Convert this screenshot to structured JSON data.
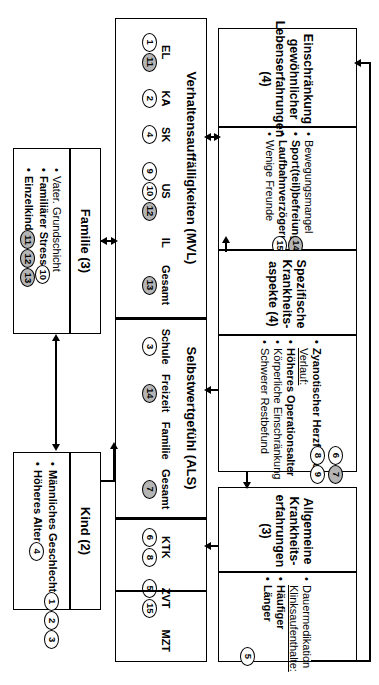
{
  "diagram": {
    "title": "",
    "orientation": "rotated-90-clockwise",
    "boxes": {
      "einschraenkung": {
        "header": "Einschränkung gewöhnlicher Lebenserfahrungen (4)",
        "items": [
          {
            "text": "Bewegungsmangel",
            "bold": false,
            "marks": []
          },
          {
            "text": "Sport(teil)befreiung",
            "bold": true,
            "marks": [
              "14"
            ]
          },
          {
            "text": "Laufbahnverzögerung",
            "bold": true,
            "marks": [
              "15"
            ]
          },
          {
            "text": "Wenige Freunde",
            "bold": false,
            "marks": []
          }
        ],
        "marks": [
          {
            "label": "14",
            "filled": true
          },
          {
            "label": "15",
            "filled": false
          }
        ]
      },
      "spezifische": {
        "header": "Spezifische Krankheits- aspekte (4)",
        "items": [
          {
            "text": "Zyanotischer Herzfehler",
            "bold": true,
            "marks": [
              "6",
              "7"
            ]
          },
          {
            "text": "Verlauf:",
            "bold": false,
            "underline": true,
            "marks": []
          },
          {
            "text": "Höheres Operationsalter",
            "bold": true,
            "marks": [
              "8",
              "9"
            ]
          },
          {
            "text": "Körperliche Einschränkung",
            "bold": false,
            "marks": []
          },
          {
            "text": "Schwerer Restbefund",
            "bold": false,
            "marks": []
          }
        ],
        "marks": [
          {
            "label": "6",
            "filled": false
          },
          {
            "label": "7",
            "filled": true
          },
          {
            "label": "8",
            "filled": false
          },
          {
            "label": "9",
            "filled": false
          }
        ]
      },
      "allgemeine": {
        "header": "Allgemeine Krankheits- erfahrungen (3)",
        "items": [
          {
            "text": "Dauermedikation",
            "bold": false,
            "marks": []
          },
          {
            "text": "Klinksaufenthalte:",
            "bold": false,
            "underline": true,
            "marks": []
          },
          {
            "text": "Häufiger",
            "bold": true,
            "marks": []
          },
          {
            "text": "Länger",
            "bold": true,
            "marks": [
              "5"
            ]
          }
        ],
        "marks": [
          {
            "label": "5",
            "filled": false
          }
        ]
      },
      "familie": {
        "header": "Familie (3)",
        "items": [
          {
            "text": "Vater. Grundschicht",
            "bold": false,
            "marks": []
          },
          {
            "text": "Familiärer Stress",
            "bold": true,
            "marks": [
              "10",
              "12"
            ]
          },
          {
            "text": "Einzelkind",
            "bold": true,
            "marks": [
              "11",
              "13"
            ]
          }
        ],
        "marks": [
          {
            "label": "10",
            "filled": false
          },
          {
            "label": "12",
            "filled": true
          },
          {
            "label": "11",
            "filled": true
          },
          {
            "label": "13",
            "filled": true
          }
        ]
      },
      "kind": {
        "header": "Kind (2)",
        "items": [
          {
            "text": "Männliches Geschlecht",
            "bold": true,
            "marks": [
              "1",
              "2",
              "3"
            ]
          },
          {
            "text": "Höheres Alter",
            "bold": true,
            "marks": [
              "4"
            ]
          }
        ],
        "marks": [
          {
            "label": "1",
            "filled": false
          },
          {
            "label": "2",
            "filled": false
          },
          {
            "label": "3",
            "filled": false
          },
          {
            "label": "4",
            "filled": false
          }
        ]
      },
      "mvl": {
        "header": "Verhaltensauffälligkeiten (MVL)",
        "columns": [
          {
            "label": "EL",
            "marks": [
              {
                "label": "1",
                "filled": false
              },
              {
                "label": "11",
                "filled": true
              }
            ]
          },
          {
            "label": "KA",
            "marks": [
              {
                "label": "2",
                "filled": false
              }
            ]
          },
          {
            "label": "SK",
            "marks": [
              {
                "label": "4",
                "filled": false
              }
            ]
          },
          {
            "label": "US",
            "marks": [
              {
                "label": "9",
                "filled": false
              },
              {
                "label": "10",
                "filled": false
              },
              {
                "label": "12",
                "filled": true
              }
            ]
          },
          {
            "label": "IL",
            "marks": []
          },
          {
            "label": "Gesamt",
            "marks": [
              {
                "label": "13",
                "filled": true
              }
            ]
          }
        ]
      },
      "als": {
        "header": "Selbstwertgefühl (ALS)",
        "columns": [
          {
            "label": "Schule",
            "marks": [
              {
                "label": "3",
                "filled": false
              }
            ]
          },
          {
            "label": "Freizeit",
            "marks": [
              {
                "label": "14",
                "filled": true
              }
            ]
          },
          {
            "label": "Familie",
            "marks": []
          },
          {
            "label": "Gesamt",
            "marks": [
              {
                "label": "7",
                "filled": true
              }
            ]
          }
        ]
      },
      "tests": {
        "header": "",
        "columns": [
          {
            "label": "KTK",
            "marks": [
              {
                "label": "6",
                "filled": false
              },
              {
                "label": "8",
                "filled": false
              }
            ]
          },
          {
            "label": "ZVT",
            "marks": [
              {
                "label": "5",
                "filled": false
              },
              {
                "label": "15",
                "filled": false
              }
            ]
          },
          {
            "label": "MZT",
            "marks": []
          }
        ]
      }
    },
    "connectors": [
      {
        "from": "einschraenkung",
        "to": "mvl",
        "type": "double-arrow"
      },
      {
        "from": "spezifische",
        "to": "einschraenkung",
        "type": "arrow"
      },
      {
        "from": "spezifische",
        "to": "als",
        "type": "arrow"
      },
      {
        "from": "spezifische",
        "to": "allgemeine",
        "type": "arrow"
      },
      {
        "from": "allgemeine",
        "to": "tests",
        "type": "arrow"
      },
      {
        "from": "allgemeine",
        "to": "einschraenkung",
        "type": "arrow-wrap-left"
      },
      {
        "from": "familie",
        "to": "mvl",
        "type": "double-arrow"
      },
      {
        "from": "kind",
        "to": "als",
        "type": "arrow"
      },
      {
        "from": "kind",
        "to": "familie",
        "type": "double-arrow"
      }
    ]
  }
}
